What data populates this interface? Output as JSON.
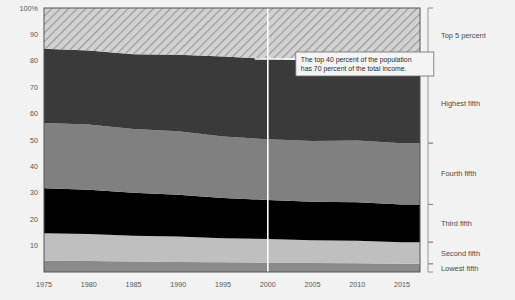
{
  "chart_data": {
    "type": "area",
    "title": "",
    "subtitle": "",
    "xlabel": "",
    "ylabel": "",
    "stacked": true,
    "normalized_percent": true,
    "grid": false,
    "legend_position": "right",
    "xlim": [
      1975,
      2017
    ],
    "ylim": [
      0,
      100
    ],
    "x_tick_labels": [
      "1975",
      "1980",
      "1985",
      "1990",
      "1995",
      "2000",
      "2005",
      "2010",
      "2015"
    ],
    "x_tick_values": [
      1975,
      1980,
      1985,
      1990,
      1995,
      2000,
      2005,
      2010,
      2015
    ],
    "y_tick_labels": [
      "10",
      "20",
      "30",
      "40",
      "50",
      "60",
      "70",
      "80",
      "90",
      "100%"
    ],
    "y_tick_values": [
      10,
      20,
      30,
      40,
      50,
      60,
      70,
      80,
      90,
      100
    ],
    "x": [
      1975,
      1980,
      1985,
      1990,
      1995,
      2000,
      2005,
      2010,
      2015,
      2017
    ],
    "series": [
      {
        "name": "Lowest fifth",
        "color": "#8a8a8a",
        "pattern": "solid",
        "values": [
          4.3,
          4.2,
          4.0,
          3.8,
          3.7,
          3.6,
          3.4,
          3.3,
          3.1,
          3.1
        ]
      },
      {
        "name": "Second fifth",
        "color": "#bfbfbf",
        "pattern": "solid",
        "values": [
          10.4,
          10.2,
          9.7,
          9.6,
          9.1,
          8.9,
          8.6,
          8.5,
          8.2,
          8.2
        ]
      },
      {
        "name": "Third fifth",
        "color": "#000000",
        "pattern": "solid",
        "values": [
          17.0,
          16.8,
          16.3,
          15.9,
          15.2,
          14.8,
          14.6,
          14.6,
          14.3,
          14.3
        ]
      },
      {
        "name": "Fourth fifth",
        "color": "#808080",
        "pattern": "solid",
        "values": [
          24.7,
          24.7,
          24.2,
          24.0,
          23.3,
          23.0,
          23.0,
          23.4,
          23.2,
          23.2
        ]
      },
      {
        "name": "Highest fifth",
        "color": "#3a3a3a",
        "pattern": "solid",
        "values": [
          28.2,
          28.0,
          28.3,
          29.0,
          30.3,
          30.5,
          30.5,
          30.2,
          30.3,
          30.3
        ]
      },
      {
        "name": "Top 5 percent",
        "color": "#c9c9c9",
        "pattern": "diagonal-hatch",
        "values": [
          15.4,
          16.1,
          17.5,
          17.7,
          18.4,
          19.2,
          19.9,
          20.0,
          20.9,
          20.9
        ]
      }
    ],
    "cumulative_boundaries": {
      "note": "Stacked cumulative tops, bottom-to-top, matching x[]",
      "lowest_fifth_top": [
        4.3,
        4.2,
        4.0,
        3.8,
        3.7,
        3.6,
        3.4,
        3.3,
        3.1,
        3.1
      ],
      "second_fifth_top": [
        14.7,
        14.4,
        13.7,
        13.4,
        12.8,
        12.5,
        12.0,
        11.8,
        11.3,
        11.3
      ],
      "third_fifth_top": [
        31.7,
        31.2,
        30.0,
        29.3,
        28.0,
        27.3,
        26.6,
        26.4,
        25.6,
        25.6
      ],
      "fourth_fifth_top": [
        56.4,
        55.9,
        54.2,
        53.3,
        51.3,
        50.3,
        49.6,
        49.8,
        48.8,
        48.8
      ],
      "highest_fifth_top": [
        84.6,
        83.9,
        82.5,
        82.3,
        81.6,
        80.8,
        80.1,
        80.0,
        79.1,
        79.1
      ],
      "top5_top": [
        100,
        100,
        100,
        100,
        100,
        100,
        100,
        100,
        100,
        100
      ]
    },
    "annotations": [
      {
        "name": "top-40-callout",
        "line1": "The top 40 percent of the population",
        "line2": "has 70 percent of the total income.",
        "pointer_x_value": 2000,
        "pointer_style": "white vertical rule full height plus horizontal leader"
      }
    ]
  },
  "legend": {
    "items": [
      {
        "label": "Top 5 percent"
      },
      {
        "label": "Highest fifth"
      },
      {
        "label": "Fourth fifth"
      },
      {
        "label": "Third fifth"
      },
      {
        "label": "Second fifth"
      },
      {
        "label": "Lowest fifth"
      }
    ]
  },
  "colors": {
    "page_background": "#f2f2f2",
    "axis_text": "#555555",
    "legend_text": "#4a4a4a",
    "callout_background": "#f4f4f4",
    "callout_border": "#6e6e6e",
    "callout_rule": "#ffffff",
    "plot_border": "#555555"
  }
}
